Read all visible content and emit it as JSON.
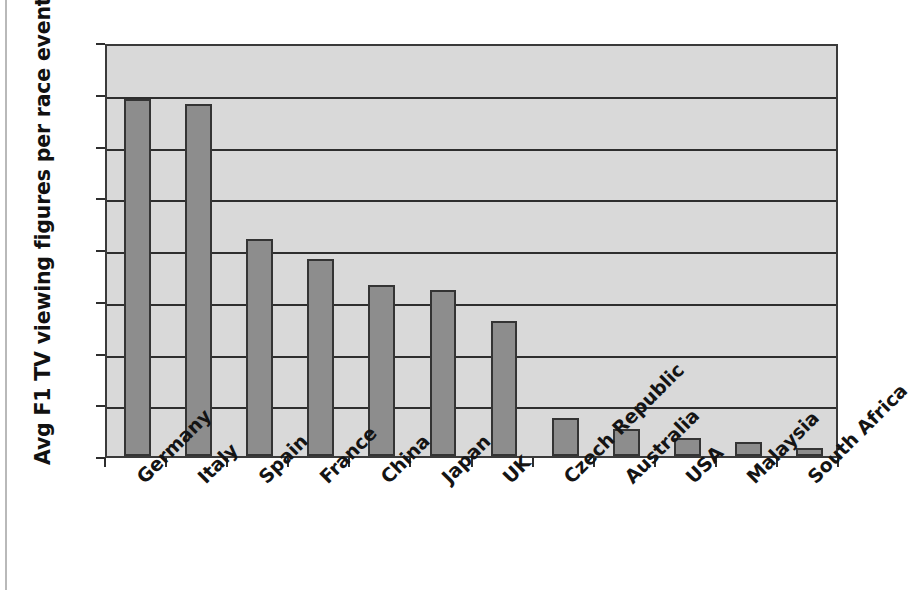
{
  "chart_data": {
    "type": "bar",
    "title": "",
    "xlabel": "",
    "ylabel": "Avg F1 TV viewing figures per race event (m)",
    "ylim": [
      0,
      8
    ],
    "ytick_labels": [
      "8",
      "7",
      "6",
      "5",
      "4",
      "3",
      "2",
      "1",
      "0"
    ],
    "ytick_values": [
      8,
      7,
      6,
      5,
      4,
      3,
      2,
      1,
      0
    ],
    "grid": true,
    "legend": "none",
    "categories": [
      "Germany",
      "Italy",
      "Spain",
      "France",
      "China",
      "Japan",
      "UK",
      "Czech Republic",
      "Australia",
      "USA",
      "Malaysia",
      "South Africa"
    ],
    "values": [
      6.9,
      6.8,
      4.2,
      3.8,
      3.3,
      3.2,
      2.6,
      0.73,
      0.52,
      0.35,
      0.28,
      0.15
    ],
    "colors": {
      "bar_fill": "#8d8d8d",
      "bar_border": "#343434",
      "plot_background": "#d9d9d9",
      "gridline": "#2e2e2e",
      "axis": "#3a3a3a",
      "text": "#111111",
      "page_background": "#ffffff"
    }
  }
}
